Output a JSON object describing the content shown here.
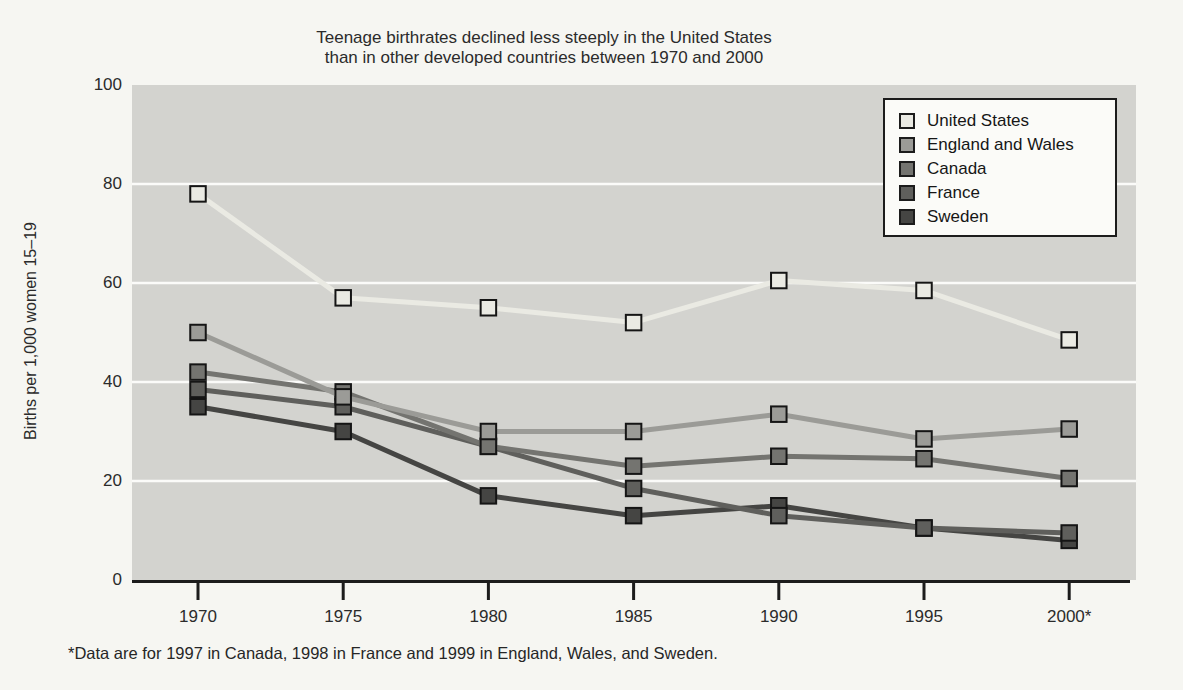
{
  "chart_data": {
    "type": "line",
    "title_line1": "Teenage birthrates declined less steeply in the United States",
    "title_line2": "than in other developed countries between 1970 and 2000",
    "ylabel": "Births per 1,000 women 15–19",
    "x_labels": [
      "1970",
      "1975",
      "1980",
      "1985",
      "1990",
      "1995",
      "2000*"
    ],
    "ylim": [
      0,
      100
    ],
    "yticks": [
      0,
      20,
      40,
      60,
      80,
      100
    ],
    "grid": "white horizontal lines at 20, 40, 60, 80",
    "legend_position": "top-right inside plot",
    "marker": "square",
    "series": [
      {
        "name": "United States",
        "color": "#eaeae3",
        "values": [
          78,
          57,
          55,
          52,
          60.5,
          58.5,
          48.5
        ]
      },
      {
        "name": "England and Wales",
        "color": "#9b9b97",
        "values": [
          50,
          37,
          30,
          30,
          33.5,
          28.5,
          30.5
        ]
      },
      {
        "name": "Canada",
        "color": "#747470",
        "values": [
          42,
          38,
          27,
          23,
          25,
          24.5,
          20.5
        ]
      },
      {
        "name": "France",
        "color": "#5f5f5c",
        "values": [
          38.5,
          35,
          27,
          18.5,
          13,
          10.5,
          9.5
        ]
      },
      {
        "name": "Sweden",
        "color": "#454543",
        "values": [
          35,
          30,
          17,
          13,
          15,
          10.5,
          8
        ]
      }
    ],
    "footnote": "*Data are for 1997 in Canada, 1998 in France and 1999 in England, Wales, and Sweden.",
    "colors": {
      "plot_background": "#d3d3cf",
      "page_background": "#f6f6f2",
      "gridline": "#fbfbf9",
      "axis": "#1c1c1c"
    }
  }
}
